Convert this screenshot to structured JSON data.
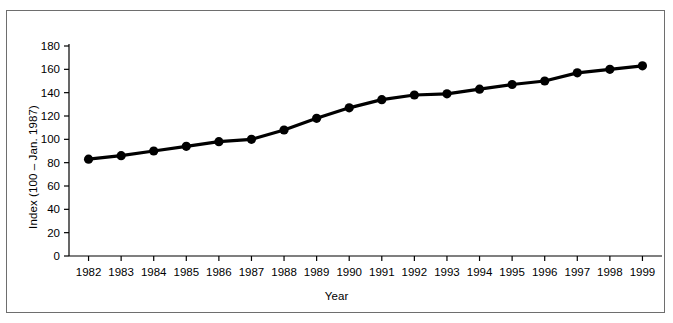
{
  "figure": {
    "background_color": "#ffffff",
    "frame_color": "#6e6e6e",
    "line_color": "#000000",
    "marker_color": "#000000"
  },
  "labels": {
    "ylabel": "Index (100 – Jan. 1987)",
    "xlabel": "Year"
  },
  "chart_data": {
    "type": "line",
    "title": "",
    "xlabel": "Year",
    "ylabel": "Index (100 – Jan. 1987)",
    "xlim": [
      1981.4,
      1999.6
    ],
    "ylim": [
      0,
      180
    ],
    "grid": false,
    "legend": null,
    "markers": "filled-circle",
    "xticks": [
      1982,
      1983,
      1984,
      1985,
      1986,
      1987,
      1988,
      1989,
      1990,
      1991,
      1992,
      1993,
      1994,
      1995,
      1996,
      1997,
      1998,
      1999
    ],
    "xticklabels": [
      "1982",
      "1983",
      "1984",
      "1985",
      "1986",
      "1987",
      "1988",
      "1989",
      "1990",
      "1991",
      "1992",
      "1993",
      "1994",
      "1995",
      "1996",
      "1997",
      "1998",
      "1999"
    ],
    "yticks": [
      0,
      20,
      40,
      60,
      80,
      100,
      120,
      140,
      160,
      180
    ],
    "yticklabels": [
      "0",
      "20",
      "40",
      "60",
      "80",
      "100",
      "120",
      "140",
      "160",
      "180"
    ],
    "x": [
      1982,
      1983,
      1984,
      1985,
      1986,
      1987,
      1988,
      1989,
      1990,
      1991,
      1992,
      1993,
      1994,
      1995,
      1996,
      1997,
      1998,
      1999
    ],
    "values": [
      83,
      86,
      90,
      94,
      98,
      100,
      108,
      118,
      127,
      134,
      138,
      139,
      143,
      147,
      150,
      157,
      160,
      163
    ],
    "series": [
      {
        "name": "Index",
        "values": [
          83,
          86,
          90,
          94,
          98,
          100,
          108,
          118,
          127,
          134,
          138,
          139,
          143,
          147,
          150,
          157,
          160,
          163
        ]
      }
    ]
  }
}
